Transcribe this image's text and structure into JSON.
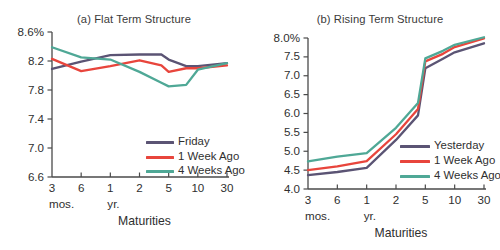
{
  "figure": {
    "background_color": "#ffffff",
    "series_colors": {
      "current": "#5b5474",
      "one_week": "#e8453c",
      "four_weeks": "#4fa896"
    }
  },
  "panel_a": {
    "title": "(a) Flat Term Structure",
    "xaxis_title": "Maturities",
    "y_ticks": [
      "8.6%",
      "8.2",
      "7.8",
      "7.4",
      "7.0",
      "6.6"
    ],
    "x_ticks": [
      "3",
      "6",
      "1",
      "2",
      "5",
      "10",
      "30"
    ],
    "x_units": [
      "mos.",
      "yr."
    ],
    "legend": [
      {
        "label": "Friday",
        "color": "#5b5474"
      },
      {
        "label": "1 Week Ago",
        "color": "#e8453c"
      },
      {
        "label": "4 Weeks Ago",
        "color": "#4fa896"
      }
    ]
  },
  "panel_b": {
    "title": "(b) Rising Term Structure",
    "xaxis_title": "Maturities",
    "y_ticks": [
      "8.0%",
      "7.5",
      "7.0",
      "6.5",
      "6.0",
      "5.5",
      "5.0",
      "4.5",
      "4.0"
    ],
    "x_ticks": [
      "3",
      "6",
      "1",
      "2",
      "5",
      "10",
      "30"
    ],
    "x_units": [
      "mos.",
      "yr."
    ],
    "legend": [
      {
        "label": "Yesterday",
        "color": "#5b5474"
      },
      {
        "label": "1 Week Ago",
        "color": "#e8453c"
      },
      {
        "label": "4 Weeks Ago",
        "color": "#4fa896"
      }
    ]
  },
  "chart_data": [
    {
      "id": "panel_a",
      "type": "line",
      "title": "(a) Flat Term Structure",
      "xlabel": "Maturities",
      "ylabel": "",
      "grid": false,
      "legend_position": "lower-center-right",
      "categories": [
        "3 mos.",
        "6 mos.",
        "1 yr.",
        "2 yr.",
        "3 yr.",
        "5 yr.",
        "7 yr.",
        "10 yr.",
        "30 yr."
      ],
      "x_tick_labels": [
        "3",
        "6",
        "1",
        "2",
        "5",
        "10",
        "30"
      ],
      "x_tick_units": [
        "mos.",
        "",
        "yr.",
        "",
        "",
        "",
        ""
      ],
      "y_tick_labels": [
        "8.6%",
        "8.2",
        "7.8",
        "7.4",
        "7.0",
        "6.6"
      ],
      "ylim": [
        6.6,
        8.6
      ],
      "ytick_values": [
        8.6,
        8.2,
        7.8,
        7.4,
        7.0,
        6.6
      ],
      "series": [
        {
          "name": "Friday",
          "color": "#5b5474",
          "values": [
            8.09,
            8.19,
            8.28,
            8.29,
            8.29,
            8.22,
            8.13,
            8.13,
            8.17
          ]
        },
        {
          "name": "1 Week Ago",
          "color": "#e8453c",
          "values": [
            8.23,
            8.06,
            8.13,
            8.21,
            8.14,
            8.05,
            8.1,
            8.1,
            8.14
          ]
        },
        {
          "name": "4 Weeks Ago",
          "color": "#4fa896",
          "values": [
            8.39,
            8.25,
            8.22,
            8.05,
            7.9,
            7.85,
            7.87,
            8.08,
            8.17
          ]
        }
      ]
    },
    {
      "id": "panel_b",
      "type": "line",
      "title": "(b) Rising Term Structure",
      "xlabel": "Maturities",
      "ylabel": "",
      "grid": false,
      "legend_position": "lower-center-right",
      "categories": [
        "3 mos.",
        "6 mos.",
        "1 yr.",
        "2 yr.",
        "3 yr.",
        "5 yr.",
        "7 yr.",
        "10 yr.",
        "30 yr."
      ],
      "x_tick_labels": [
        "3",
        "6",
        "1",
        "2",
        "5",
        "10",
        "30"
      ],
      "x_tick_units": [
        "mos.",
        "",
        "yr.",
        "",
        "",
        "",
        ""
      ],
      "y_tick_labels": [
        "8.0%",
        "7.5",
        "7.0",
        "6.5",
        "6.0",
        "5.5",
        "5.0",
        "4.5",
        "4.0"
      ],
      "ylim": [
        4.0,
        8.0
      ],
      "ytick_values": [
        8.0,
        7.5,
        7.0,
        6.5,
        6.0,
        5.5,
        5.0,
        4.5,
        4.0
      ],
      "series": [
        {
          "name": "Yesterday",
          "color": "#5b5474",
          "values": [
            4.37,
            4.45,
            4.56,
            5.3,
            5.95,
            7.2,
            7.45,
            7.62,
            7.86
          ]
        },
        {
          "name": "1 Week Ago",
          "color": "#e8453c",
          "values": [
            4.5,
            4.6,
            4.74,
            5.45,
            6.12,
            7.38,
            7.58,
            7.76,
            7.99
          ]
        },
        {
          "name": "4 Weeks Ago",
          "color": "#4fa896",
          "values": [
            4.73,
            4.86,
            4.95,
            5.62,
            6.28,
            7.46,
            7.66,
            7.82,
            8.02
          ]
        }
      ]
    }
  ]
}
